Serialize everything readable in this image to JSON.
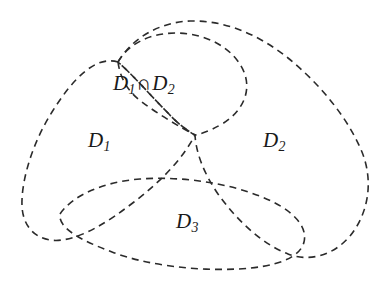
{
  "figure": {
    "type": "venn-diagram",
    "background_color": "#ffffff",
    "stroke_color": "#2b2b2b",
    "stroke_width": 1.6,
    "dash_pattern": "7 5",
    "width": 389,
    "height": 283
  },
  "labels": {
    "intersection": {
      "base": "D",
      "sub1": "1",
      "operator": "∩",
      "base2": "D",
      "sub2": "2",
      "plain": "D1∩D2"
    },
    "d1": {
      "base": "D",
      "sub": "1",
      "plain": "D1"
    },
    "d2": {
      "base": "D",
      "sub": "2",
      "plain": "D2"
    },
    "d3": {
      "base": "D",
      "sub": "3",
      "plain": "D3"
    }
  },
  "curves": {
    "d1_boundary": {
      "name": "D1 region outline",
      "path": "M 118 62 C 95 55 72 80 52 112 C 33 142 21 180 22 206 C 23 230 40 243 62 240 C 84 237 108 222 134 202 C 160 182 182 160 195 135 C 186 130 176 122 168 113 C 150 95 134 76 118 62 Z"
    },
    "d2_boundary": {
      "name": "D2 region outline",
      "path": "M 118 62 C 132 38 160 22 190 21 C 224 20 258 34 288 58 C 320 84 348 118 362 152 C 374 182 368 214 350 236 C 333 256 309 262 288 254 C 264 245 238 222 218 194 C 203 172 196 152 195 135 C 186 130 176 122 168 113 C 150 95 134 76 118 62 Z"
    },
    "lens_top": {
      "name": "D1 intersect D2 lens upper arc",
      "path": "M 118 62 C 128 44 150 33 176 33 C 206 33 234 48 244 72 C 252 92 242 112 222 124 C 208 132 200 134 195 135"
    },
    "lens_bottom": {
      "name": "D1 intersect D2 lens lower arc",
      "path": "M 118 62 C 120 78 128 92 142 102 C 158 114 178 126 195 135"
    },
    "d3_oval": {
      "name": "D3 oval outline",
      "path": "M 60 214 C 72 196 102 182 140 179 C 182 176 228 183 262 197 C 292 209 308 226 304 242 C 300 258 276 267 238 269 C 194 271 146 265 112 252 C 80 240 58 228 60 214 Z"
    }
  },
  "crossings": [
    {
      "name": "upper-left-node",
      "x": 118,
      "y": 62
    },
    {
      "name": "center-x-node",
      "x": 195,
      "y": 135
    },
    {
      "name": "d3-left-d1-node",
      "x": 137,
      "y": 180
    },
    {
      "name": "d3-right-d2-node",
      "x": 246,
      "y": 189
    },
    {
      "name": "d3-lower-left-node",
      "x": 61,
      "y": 215
    },
    {
      "name": "d3-lower-right-node",
      "x": 304,
      "y": 243
    }
  ]
}
